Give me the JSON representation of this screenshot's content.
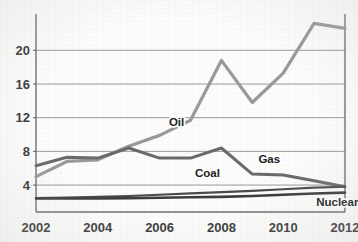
{
  "chart_data": {
    "type": "line",
    "title": "",
    "subtitle": "",
    "xlabel": "",
    "ylabel": "",
    "x": [
      2002,
      2003,
      2004,
      2005,
      2006,
      2007,
      2008,
      2009,
      2010,
      2011,
      2012
    ],
    "xlim": [
      2002,
      2012
    ],
    "ylim": [
      0.8,
      23.6
    ],
    "grid": true,
    "gridlines_y": [
      4,
      8,
      12,
      16,
      20
    ],
    "legend_position": "inline-annotations",
    "xticks": [
      2002,
      2004,
      2006,
      2008,
      2010,
      2012
    ],
    "xtick_labels": [
      "2002",
      "2004",
      "2006",
      "2008",
      "2010",
      "2012"
    ],
    "yticks": [
      4,
      8,
      12,
      16,
      20
    ],
    "ytick_labels": [
      "4",
      "8",
      "12",
      "16",
      "20"
    ],
    "series": [
      {
        "name": "Oil",
        "color": "#9a9a9a",
        "label_text": "Oil",
        "values": [
          5.0,
          6.8,
          7.0,
          8.6,
          9.9,
          11.7,
          18.8,
          13.8,
          17.3,
          23.2,
          22.6
        ]
      },
      {
        "name": "Gas",
        "color": "#6a6a6a",
        "label_text": "Gas",
        "values": [
          6.3,
          7.3,
          7.2,
          8.4,
          7.2,
          7.2,
          8.4,
          5.3,
          5.2,
          4.5,
          3.8
        ]
      },
      {
        "name": "Coal",
        "color": "#4a4a4a",
        "label_text": "Coal",
        "values": [
          2.45,
          2.5,
          2.6,
          2.7,
          2.85,
          3.0,
          3.15,
          3.3,
          3.5,
          3.7,
          3.8
        ]
      },
      {
        "name": "Nuclear",
        "color": "#3c3c3c",
        "label_text": "Nuclear",
        "values": [
          2.4,
          2.4,
          2.4,
          2.45,
          2.5,
          2.55,
          2.6,
          2.7,
          2.85,
          3.0,
          3.1
        ]
      }
    ],
    "annotations": [
      {
        "text": "Oil",
        "x": 2006.55,
        "y": 11.0,
        "for_series": "Oil"
      },
      {
        "text": "Gas",
        "x": 2009.55,
        "y": 6.6,
        "for_series": "Gas"
      },
      {
        "text": "Coal",
        "x": 2007.55,
        "y": 5.0,
        "for_series": "Coal"
      },
      {
        "text": "Nuclear",
        "x": 2011.75,
        "y": 1.55,
        "for_series": "Nuclear"
      }
    ]
  }
}
